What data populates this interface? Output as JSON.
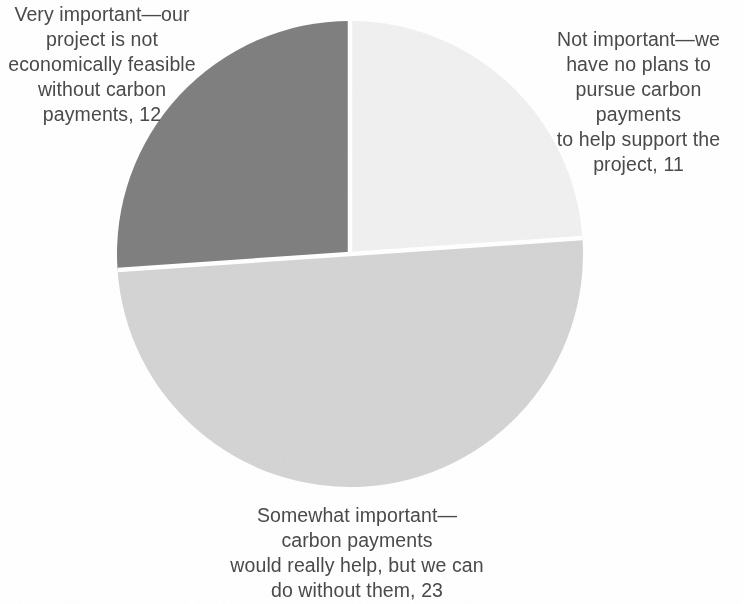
{
  "chart_data": {
    "type": "pie",
    "title": "",
    "subtitle": "",
    "xlabel": "",
    "ylabel": "",
    "total": 46,
    "legend_position": "none",
    "grid": false,
    "labels_show_value": true,
    "start_angle_deg": 0,
    "direction": "clockwise",
    "categories": [
      "Not important—we have no plans to pursue carbon payments to help support the project",
      "Somewhat important—carbon payments would really help, but we can do without them",
      "Very important—our project is not economically feasible without carbon payments"
    ],
    "values": [
      11,
      23,
      12
    ],
    "colors": [
      "#f0f0f0",
      "#d4d4d4",
      "#808080"
    ],
    "slices": [
      {
        "name": "not-important",
        "short_label": "Not important",
        "value": 11,
        "color": "#f0f0f0",
        "start_deg": 0,
        "end_deg": 86.087,
        "percent": 23.9
      },
      {
        "name": "somewhat-important",
        "short_label": "Somewhat important",
        "value": 23,
        "color": "#d4d4d4",
        "start_deg": 86.087,
        "end_deg": 266.087,
        "percent": 50.0
      },
      {
        "name": "very-important",
        "short_label": "Very important",
        "value": 12,
        "color": "#808080",
        "start_deg": 266.087,
        "end_deg": 360,
        "percent": 26.1
      }
    ],
    "annotations": [
      "Not important—we have no plans to pursue carbon payments to help support the project, 11",
      "Somewhat important—carbon payments would really help, but we can do without them, 23",
      "Very important—our project is not economically feasible without carbon payments, 12"
    ]
  },
  "labels": {
    "very_important": "Very important—our\nproject is not\neconomically feasible\nwithout carbon\npayments, 12",
    "not_important": "Not important—we\nhave no plans to\npursue carbon payments\nto help support the\nproject, 11",
    "somewhat_important": "Somewhat important—\ncarbon payments\nwould really help, but we can\ndo without them, 23"
  },
  "style": {
    "background": "#ffffff",
    "text_color": "#4a4a4a",
    "divider_color": "#ffffff",
    "slice_dark": "#808080",
    "slice_mid": "#d4d4d4",
    "slice_light": "#f0f0f0"
  }
}
